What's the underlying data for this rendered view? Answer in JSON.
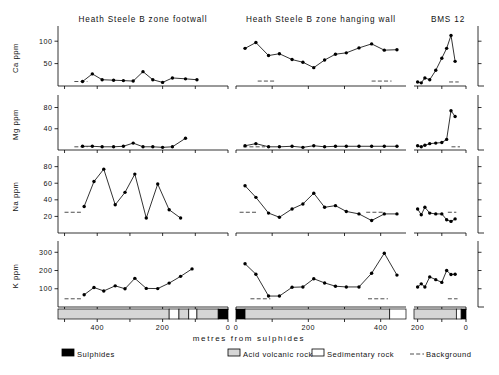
{
  "figure": {
    "xaxis_title": "metres  from  sulphides",
    "panel_titles": {
      "left": "Heath Steele B zone footwall",
      "middle": "Heath Steele B zone hanging wall",
      "right": "BMS 12"
    },
    "row_labels": [
      "Ca ppm",
      "Mg ppm",
      "Na ppm",
      "K ppm"
    ]
  },
  "legend": {
    "items": [
      {
        "label": "Sulphides",
        "swatch": "black",
        "color": "#000000"
      },
      {
        "label": "Acid volcanic rock",
        "swatch": "gray",
        "color": "#d6d6d6"
      },
      {
        "label": "Sedimentary rock",
        "swatch": "white",
        "color": "#ffffff"
      },
      {
        "label": "Background",
        "swatch": "dashed-line",
        "color": "#000000"
      }
    ]
  },
  "chart_data": {
    "type": "line",
    "xlabel": "metres from sulphides",
    "grid": false,
    "legend_position": "bottom",
    "panels": [
      {
        "name": "left",
        "title": "Heath Steele B zone footwall",
        "x_direction": "decreasing",
        "xlim": [
          520,
          0
        ],
        "xticks": [
          500,
          400,
          300,
          200,
          100,
          0
        ],
        "xticklabels": [
          "",
          "400",
          "",
          "200",
          "",
          "0"
        ],
        "lithology": [
          {
            "from": 520,
            "to": 180,
            "rock": "Acid volcanic rock",
            "color": "#d6d6d6"
          },
          {
            "from": 180,
            "to": 150,
            "rock": "Sedimentary rock",
            "color": "#ffffff"
          },
          {
            "from": 150,
            "to": 120,
            "rock": "Acid volcanic rock",
            "color": "#d6d6d6"
          },
          {
            "from": 120,
            "to": 95,
            "rock": "Sedimentary rock",
            "color": "#ffffff"
          },
          {
            "from": 95,
            "to": 30,
            "rock": "Acid volcanic rock",
            "color": "#d6d6d6"
          },
          {
            "from": 30,
            "to": 0,
            "rock": "Sulphides",
            "color": "#000000"
          }
        ],
        "series": [
          {
            "element": "Ca",
            "ylabel": "Ca ppm",
            "ylim": [
              0,
              125
            ],
            "yticks": [
              50,
              100
            ],
            "background": 10,
            "background_span": [
              470,
              430
            ],
            "x": [
              445,
              415,
              385,
              350,
              320,
              290,
              260,
              230,
              200,
              170,
              130,
              95
            ],
            "values": [
              10,
              27,
              14,
              13,
              12,
              11,
              32,
              14,
              8,
              18,
              16,
              14,
              17
            ]
          },
          {
            "element": "Mg",
            "ylabel": "Mg ppm",
            "ylim": [
              0,
              96
            ],
            "yticks": [
              40,
              80
            ],
            "background": 6,
            "background_span": [
              470,
              430
            ],
            "x": [
              445,
              415,
              385,
              350,
              320,
              290,
              260,
              230,
              200,
              170,
              130,
              95
            ],
            "values": [
              7,
              7,
              6,
              6,
              7,
              13,
              6,
              6,
              5,
              6,
              22
            ]
          },
          {
            "element": "Na",
            "ylabel": "Na ppm",
            "ylim": [
              0,
              88
            ],
            "yticks": [
              20,
              40,
              60,
              80
            ],
            "background": 25,
            "background_span": [
              500,
              450
            ],
            "x": [
              440,
              410,
              380,
              345,
              315,
              285,
              250,
              215,
              180,
              145,
              110
            ],
            "values": [
              32,
              62,
              77,
              34,
              49,
              71,
              18,
              59,
              28,
              18
            ]
          },
          {
            "element": "K",
            "ylabel": "K ppm",
            "ylim": [
              0,
              340
            ],
            "yticks": [
              100,
              200,
              300
            ],
            "background": 45,
            "background_span": [
              500,
              450
            ],
            "x": [
              440,
              410,
              380,
              345,
              315,
              285,
              250,
              215,
              180,
              145,
              110
            ],
            "values": [
              67,
              107,
              88,
              116,
              100,
              157,
              102,
              101,
              131,
              168,
              209
            ]
          }
        ]
      },
      {
        "name": "middle",
        "title": "Heath Steele B zone hanging wall",
        "x_direction": "increasing",
        "xlim": [
          0,
          470
        ],
        "xticks": [
          0,
          100,
          200,
          300,
          400
        ],
        "xticklabels": [
          "0",
          "",
          "200",
          "",
          "400"
        ],
        "lithology": [
          {
            "from": 0,
            "to": 25,
            "rock": "Sulphides",
            "color": "#000000"
          },
          {
            "from": 25,
            "to": 425,
            "rock": "Acid volcanic rock",
            "color": "#d6d6d6"
          },
          {
            "from": 425,
            "to": 470,
            "rock": "Sedimentary rock",
            "color": "#ffffff"
          }
        ],
        "series": [
          {
            "element": "Ca",
            "ylabel": "Ca ppm",
            "ylim": [
              0,
              125
            ],
            "yticks": [
              50,
              100
            ],
            "background": 11,
            "background_span": [
              60,
              110
            ],
            "background_span2": [
              375,
              430
            ],
            "x": [
              25,
              55,
              90,
              120,
              155,
              185,
              215,
              245,
              275,
              305,
              340,
              375,
              410,
              445
            ],
            "values": [
              84,
              97,
              68,
              72,
              59,
              53,
              41,
              58,
              71,
              74,
              85,
              94,
              80,
              81
            ]
          },
          {
            "element": "Mg",
            "ylabel": "Mg ppm",
            "ylim": [
              0,
              96
            ],
            "yticks": [
              40,
              80
            ],
            "background": 6,
            "background_span": [
              20,
              80
            ],
            "x": [
              25,
              55,
              90,
              120,
              155,
              185,
              215,
              245,
              275,
              305,
              340,
              375,
              410,
              445
            ],
            "values": [
              8,
              12,
              6,
              6,
              7,
              5,
              8,
              6,
              7,
              7,
              7,
              7,
              7,
              7
            ]
          },
          {
            "element": "Na",
            "ylabel": "Na ppm",
            "ylim": [
              0,
              88
            ],
            "yticks": [
              20,
              40,
              60,
              80
            ],
            "background": 25,
            "background_span": [
              10,
              60
            ],
            "background_span2": [
              360,
              410
            ],
            "x": [
              25,
              55,
              90,
              120,
              155,
              185,
              215,
              245,
              275,
              305,
              340,
              375,
              410,
              445
            ],
            "values": [
              57,
              43,
              24,
              19,
              29,
              35,
              48,
              31,
              33,
              26,
              23,
              15,
              23,
              23
            ]
          },
          {
            "element": "K",
            "ylabel": "K ppm",
            "ylim": [
              0,
              340
            ],
            "yticks": [
              100,
              200,
              300
            ],
            "background": 45,
            "background_span": [
              40,
              95
            ],
            "background_span2": [
              365,
              420
            ],
            "x": [
              25,
              55,
              90,
              120,
              155,
              185,
              215,
              245,
              275,
              305,
              340,
              375,
              410,
              445
            ],
            "values": [
              237,
              180,
              60,
              60,
              108,
              110,
              155,
              132,
              114,
              110,
              110,
              185,
              295,
              175
            ]
          }
        ]
      },
      {
        "name": "right",
        "title": "BMS 12",
        "x_direction": "decreasing",
        "xlim": [
          215,
          0
        ],
        "xticks": [
          200,
          100,
          0
        ],
        "xticklabels": [
          "200",
          "",
          "0"
        ],
        "lithology": [
          {
            "from": 215,
            "to": 40,
            "rock": "Acid volcanic rock",
            "color": "#d6d6d6"
          },
          {
            "from": 40,
            "to": 20,
            "rock": "Sedimentary rock",
            "color": "#ffffff"
          },
          {
            "from": 20,
            "to": 0,
            "rock": "Sulphides",
            "color": "#000000"
          }
        ],
        "series": [
          {
            "element": "Ca",
            "ylabel": "Ca ppm",
            "ylim": [
              0,
              125
            ],
            "yticks": [
              50,
              100
            ],
            "background": 9,
            "background_span": [
              70,
              30
            ],
            "x": [
              200,
              185,
              170,
              150,
              125,
              100,
              80,
              62,
              45
            ],
            "values": [
              9,
              7,
              18,
              14,
              35,
              62,
              84,
              113,
              55,
              38
            ]
          },
          {
            "element": "Mg",
            "ylabel": "Mg ppm",
            "ylim": [
              0,
              96
            ],
            "yticks": [
              40,
              80
            ],
            "background": 6,
            "background_span": [
              60,
              25
            ],
            "x": [
              200,
              185,
              170,
              150,
              125,
              100,
              80,
              62,
              45
            ],
            "values": [
              8,
              6,
              9,
              12,
              13,
              14,
              20,
              74,
              63
            ]
          },
          {
            "element": "Na",
            "ylabel": "Na ppm",
            "ylim": [
              0,
              88
            ],
            "yticks": [
              20,
              40,
              60,
              80
            ],
            "background": 25,
            "background_span": [
              75,
              40
            ],
            "x": [
              200,
              185,
              170,
              150,
              125,
              100,
              80,
              62,
              45
            ],
            "values": [
              29,
              22,
              31,
              24,
              23,
              23,
              16,
              14,
              17
            ]
          },
          {
            "element": "K",
            "ylabel": "K ppm",
            "ylim": [
              0,
              340
            ],
            "yticks": [
              100,
              200,
              300
            ],
            "background": 45,
            "background_span": [
              75,
              35
            ],
            "x": [
              200,
              185,
              170,
              150,
              125,
              100,
              80,
              62,
              45
            ],
            "values": [
              110,
              127,
              110,
              165,
              150,
              135,
              200,
              178,
              180
            ]
          }
        ]
      }
    ]
  }
}
